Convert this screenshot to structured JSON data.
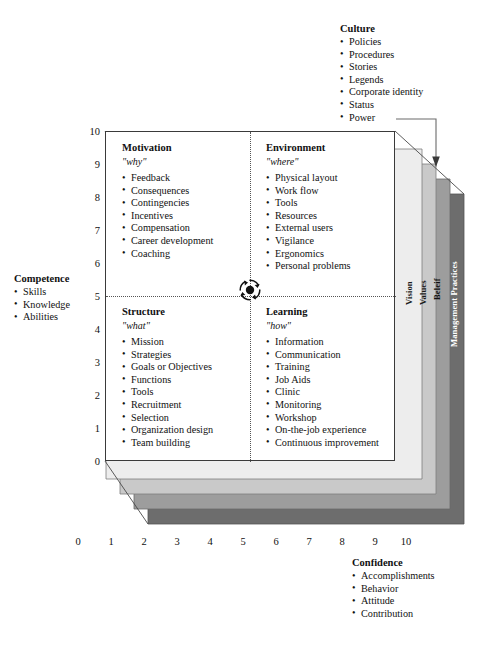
{
  "diagram": {
    "center_icon": "cycle-arrows-icon"
  },
  "axes": {
    "x": {
      "label": "",
      "ticks": [
        "0",
        "1",
        "2",
        "3",
        "4",
        "5",
        "6",
        "7",
        "8",
        "9",
        "10"
      ],
      "min": 0,
      "max": 10
    },
    "y": {
      "label": "",
      "ticks": [
        "10",
        "9",
        "8",
        "7",
        "6",
        "5",
        "4",
        "3",
        "2",
        "1",
        "0"
      ],
      "min": 0,
      "max": 10
    }
  },
  "quadrants": [
    {
      "key": "motivation",
      "title": "Motivation",
      "subtitle": "\"why\"",
      "items": [
        "Feedback",
        "Consequences",
        "Contingencies",
        "Incentives",
        "Compensation",
        "Career development",
        "Coaching"
      ]
    },
    {
      "key": "environment",
      "title": "Environment",
      "subtitle": "\"where\"",
      "items": [
        "Physical layout",
        "Work flow",
        "Tools",
        "Resources",
        "External users",
        "Vigilance",
        "Ergonomics",
        "Personal problems"
      ]
    },
    {
      "key": "structure",
      "title": "Structure",
      "subtitle": "\"what\"",
      "items": [
        "Mission",
        "Strategies",
        "Goals or Objectives",
        "Functions",
        "Tools",
        "Recruitment",
        "Selection",
        "Organization design",
        "Team building"
      ]
    },
    {
      "key": "learning",
      "title": "Learning",
      "subtitle": "\"how\"",
      "items": [
        "Information",
        "Communication",
        "Training",
        "Job Aids",
        "Clinic",
        "Monitoring",
        "Workshop",
        "On-the-job experience",
        "Continuous improvement"
      ]
    }
  ],
  "annotations": {
    "culture": {
      "title": "Culture",
      "items": [
        "Policies",
        "Procedures",
        "Stories",
        "Legends",
        "Corporate identity",
        "Status",
        "Power"
      ],
      "leader_from": "Power"
    },
    "competence": {
      "title": "Competence",
      "items": [
        "Skills",
        "Knowledge",
        "Abilities"
      ]
    },
    "confidence": {
      "title": "Confidence",
      "items": [
        "Accomplishments",
        "Behavior",
        "Attitude",
        "Contribution"
      ]
    }
  },
  "layers": [
    {
      "name": "Vision",
      "color": "#ededed"
    },
    {
      "name": "Values",
      "color": "#c9c9c9"
    },
    {
      "name": "Beleif",
      "color": "#9d9d9d"
    },
    {
      "name": "Management Practices",
      "color": "#6d6d6d"
    }
  ],
  "colors": {
    "plot_face": "#ffffff",
    "frame": "#3a3a3a",
    "divider": "#555555",
    "text": "#111111",
    "leader": "#6b6b6b"
  },
  "caption": ""
}
